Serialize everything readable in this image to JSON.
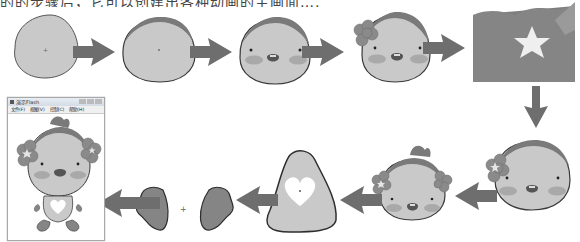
{
  "caption": {
    "text": "的的步骤后，它可以创建出各种动画的主画面……",
    "note": "top line clipped; only lower half of glyphs visible"
  },
  "window": {
    "title": "演示Flash",
    "menu": [
      "文件(F)",
      "视图(V)",
      "控制(C)",
      "帮助(H)"
    ]
  },
  "steps": [
    {
      "id": 1,
      "label": "base-head-shape"
    },
    {
      "id": 2,
      "label": "head-with-hair-band"
    },
    {
      "id": 3,
      "label": "add-eyes-cheeks-mouth"
    },
    {
      "id": 4,
      "label": "add-flower-ornament"
    },
    {
      "id": 5,
      "label": "star-symbol-zoom"
    },
    {
      "id": 6,
      "label": "head-with-flower-large"
    },
    {
      "id": 7,
      "label": "head-with-two-flowers-and-crest"
    },
    {
      "id": 8,
      "label": "body-with-heart"
    },
    {
      "id": 9,
      "label": "left-foot"
    },
    {
      "id": 10,
      "label": "right-foot"
    },
    {
      "id": 11,
      "label": "final-character-in-window"
    }
  ],
  "colors": {
    "skin": "#c9c9c9",
    "outline": "#3a3a3a",
    "arrow": "#6e6e6e",
    "hair": "#7a7a7a",
    "cheek": "#a9a9a9",
    "dark_fill": "#8a8a8a",
    "star": "#efefef"
  }
}
